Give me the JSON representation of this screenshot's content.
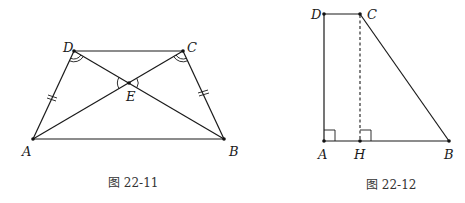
{
  "figures": [
    {
      "id": "fig1",
      "caption": "图 22-11",
      "description": "Isosceles trapezoid ABCD with diagonals AC and BD intersecting at E; AD = BC marked with double ticks; equal angles at D and C marked with double arcs; vertical angles at E marked with arcs",
      "points": {
        "A": {
          "label": "A",
          "x": 33,
          "y": 139
        },
        "B": {
          "label": "B",
          "x": 224,
          "y": 139
        },
        "C": {
          "label": "C",
          "x": 183,
          "y": 51
        },
        "D": {
          "label": "D",
          "x": 74,
          "y": 51
        },
        "E": {
          "label": "E",
          "x": 129,
          "y": 83
        }
      },
      "segments": [
        "AB",
        "BC",
        "CD",
        "DA",
        "AC",
        "BD"
      ],
      "marks": {
        "equal_sides": [
          "AD",
          "BC"
        ],
        "equal_angles": [
          "ADB",
          "BCA"
        ],
        "angle_at_E": [
          "AED",
          "BEC"
        ]
      }
    },
    {
      "id": "fig2",
      "caption": "图 22-12",
      "description": "Right trapezoid ABCD with DA perpendicular to AB; CH dashed altitude from C to AB with right angle at H",
      "points": {
        "A": {
          "label": "A",
          "x": 324,
          "y": 141
        },
        "B": {
          "label": "B",
          "x": 449,
          "y": 141
        },
        "C": {
          "label": "C",
          "x": 360,
          "y": 14
        },
        "D": {
          "label": "D",
          "x": 324,
          "y": 14
        },
        "H": {
          "label": "H",
          "x": 360,
          "y": 141
        }
      },
      "segments": [
        "AB",
        "BC",
        "CD",
        "DA"
      ],
      "dashed_segments": [
        "CH"
      ],
      "marks": {
        "right_angles": [
          "DAB",
          "CHB"
        ]
      }
    }
  ]
}
